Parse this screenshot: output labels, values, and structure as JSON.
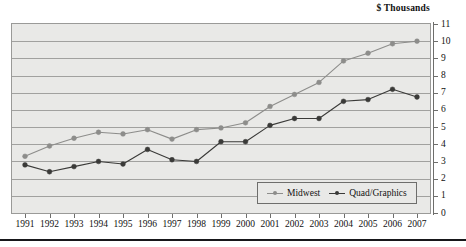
{
  "chart_data": {
    "type": "line",
    "title": "$ Thousands",
    "xlabel": "",
    "ylabel": "",
    "ylim": [
      0,
      11
    ],
    "ytick_step": 1,
    "grid": true,
    "grid_axis": "y",
    "legend_position": "bottom-right",
    "categories": [
      "1991",
      "1992",
      "1993",
      "1994",
      "1995",
      "1996",
      "1997",
      "1998",
      "1999",
      "2000",
      "2001",
      "2002",
      "2003",
      "2004",
      "2005",
      "2006",
      "2007"
    ],
    "yticks": [
      "0",
      "1",
      "2",
      "3",
      "4",
      "5",
      "6",
      "7",
      "8",
      "9",
      "10",
      "11"
    ],
    "series": [
      {
        "name": "Midwest",
        "color": "#8d8d8b",
        "values": [
          3.3,
          3.9,
          4.35,
          4.7,
          4.6,
          4.85,
          4.3,
          4.85,
          4.95,
          5.25,
          6.2,
          6.9,
          7.6,
          8.85,
          9.3,
          9.85,
          10.0
        ]
      },
      {
        "name": "Quad/Graphics",
        "color": "#3a3a38",
        "values": [
          2.8,
          2.4,
          2.7,
          3.0,
          2.85,
          3.7,
          3.1,
          3.0,
          4.15,
          4.15,
          5.1,
          5.5,
          5.5,
          6.5,
          6.6,
          7.2,
          6.75
        ]
      }
    ]
  },
  "legend": {
    "items": [
      {
        "label": "Midwest"
      },
      {
        "label": "Quad/Graphics"
      }
    ]
  },
  "colors": {
    "plot_background": "#e9e9e7",
    "axis": "#6e6e6c",
    "gridline": "#8f8f8d",
    "midwest": "#8d8d8b",
    "quad": "#3a3a38",
    "rule": "#17171a"
  }
}
